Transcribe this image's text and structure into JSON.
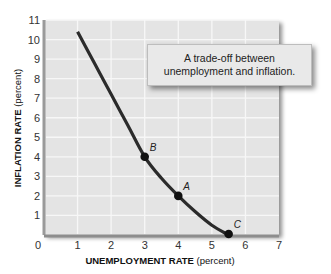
{
  "chart_data": {
    "type": "line",
    "title": "",
    "xlabel": {
      "bold": "UNEMPLOYMENT RATE",
      "normal": " (percent)"
    },
    "ylabel": {
      "bold": "INFLATION RATE",
      "normal": " (percent)"
    },
    "xlim": [
      0,
      7
    ],
    "ylim": [
      0,
      11
    ],
    "xticks": [
      0,
      1,
      2,
      3,
      4,
      5,
      6,
      7
    ],
    "yticks": [
      1,
      2,
      3,
      4,
      5,
      6,
      7,
      8,
      9,
      10,
      11
    ],
    "grid": true,
    "series": [
      {
        "name": "Phillips curve",
        "x": [
          1,
          1.5,
          2,
          2.5,
          3,
          3.5,
          4,
          4.5,
          5,
          5.5
        ],
        "y": [
          10.4,
          8.8,
          7.2,
          5.6,
          4.0,
          2.9,
          2.0,
          1.2,
          0.5,
          0.0
        ],
        "color": "#2b2b2b"
      }
    ],
    "points": [
      {
        "label": "B",
        "x": 3,
        "y": 4
      },
      {
        "label": "A",
        "x": 4,
        "y": 2
      },
      {
        "label": "C",
        "x": 5.5,
        "y": 0
      }
    ],
    "annotation": {
      "line1": "A trade-off between",
      "line2": "unemployment and inflation."
    },
    "colors": {
      "plot_bg": "#e4e4e4",
      "grid": "#f7f7f7",
      "curve": "#2b2b2b",
      "frame": "#9a9a9a"
    }
  }
}
